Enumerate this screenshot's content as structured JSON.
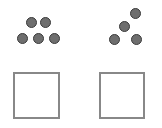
{
  "diagram": {
    "panels": [
      {
        "name": "left",
        "dot_count": 5,
        "dots": [
          {
            "x": 31,
            "y": 22
          },
          {
            "x": 45,
            "y": 22
          },
          {
            "x": 22,
            "y": 38
          },
          {
            "x": 38,
            "y": 38
          },
          {
            "x": 54,
            "y": 38
          }
        ],
        "box": {
          "x": 13,
          "y": 72,
          "w": 47,
          "h": 47
        }
      },
      {
        "name": "right",
        "dot_count": 4,
        "dots": [
          {
            "x": 135,
            "y": 13
          },
          {
            "x": 124,
            "y": 26
          },
          {
            "x": 114,
            "y": 39
          },
          {
            "x": 136,
            "y": 39
          }
        ],
        "box": {
          "x": 99,
          "y": 72,
          "w": 46,
          "h": 47
        }
      }
    ],
    "colors": {
      "dot_fill": "#6e6e6e",
      "dot_border": "#3a3a3a",
      "box_border": "#888888"
    }
  }
}
